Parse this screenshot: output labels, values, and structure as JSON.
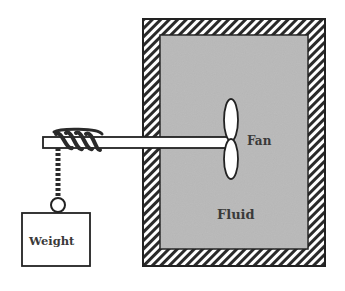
{
  "diagram": {
    "labels": {
      "fan": "Fan",
      "fluid": "Fluid",
      "weight": "Weight"
    },
    "components": [
      "insulated-container",
      "fluid",
      "fan",
      "shaft",
      "rope",
      "weight"
    ],
    "colors": {
      "fluid": "#b9b9b9",
      "wall_hatch": "#2a2a2a",
      "background": "#ffffff",
      "stroke": "#222222"
    }
  }
}
